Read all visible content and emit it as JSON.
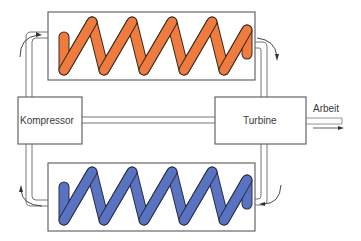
{
  "diagram": {
    "title": "",
    "components": {
      "compressor": {
        "label": "Kompressor"
      },
      "turbine": {
        "label": "Turbine"
      },
      "hot_exchanger": {
        "label": "",
        "coil_color": "#ef7b3e"
      },
      "cold_exchanger": {
        "label": "",
        "coil_color": "#5a73c0"
      }
    },
    "output": {
      "label": "Arbeit"
    },
    "colors": {
      "line": "#555555",
      "hot_coil": "#ef7b3e",
      "cold_coil": "#5a73c0",
      "coil_outline": "#3a2a20"
    },
    "flow_direction": "clockwise"
  }
}
